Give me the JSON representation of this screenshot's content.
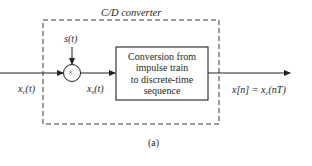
{
  "diagram": {
    "title": "C/D converter",
    "caption": "(a)",
    "input_signal": {
      "name": "x",
      "sub": "c",
      "arg": "(t)"
    },
    "sampling_signal": {
      "label": "s(t)"
    },
    "multiplier": {
      "symbol": "×"
    },
    "sampled_signal": {
      "name": "x",
      "sub": "s",
      "arg": "(t)"
    },
    "conversion_block": {
      "lines": [
        "Conversion from",
        "impulse train",
        "to discrete-time",
        "sequence"
      ]
    },
    "output_signal": {
      "lhs": "x[n] = x",
      "sub": "c",
      "rhs": "(nT)"
    },
    "colors": {
      "stroke": "#231f20",
      "background": "#ffffff"
    }
  }
}
